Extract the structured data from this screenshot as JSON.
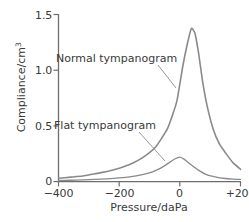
{
  "chart_data": {
    "type": "line",
    "title": "",
    "xlabel": "Pressure/daPa",
    "ylabel": "Compliance/cm",
    "ylabel_sup": "3",
    "xlim": [
      -400,
      200
    ],
    "ylim": [
      0,
      1.5
    ],
    "xticks": [
      "−400",
      "−200",
      "0",
      "+200"
    ],
    "xtick_values": [
      -400,
      -200,
      0,
      200
    ],
    "yticks": [
      "0",
      "0.5",
      "1.0",
      "1.5"
    ],
    "ytick_values": [
      0,
      0.5,
      1.0,
      1.5
    ],
    "grid": false,
    "legend": "annotations",
    "line_color": "#8a8a8a",
    "axis_color": "#6e6e6e",
    "text_color": "#3a3a3a",
    "series": [
      {
        "name": "Normal tympanogram",
        "annotation": "Normal tympanogram",
        "peak_x": 38,
        "peak_y": 1.375,
        "x": [
          -400,
          -360,
          -320,
          -280,
          -240,
          -200,
          -160,
          -120,
          -80,
          -40,
          -10,
          10,
          25,
          38,
          50,
          62,
          75,
          90,
          110,
          130,
          150,
          175,
          200
        ],
        "y": [
          0.03,
          0.04,
          0.05,
          0.07,
          0.09,
          0.12,
          0.16,
          0.22,
          0.31,
          0.48,
          0.72,
          1.04,
          1.24,
          1.375,
          1.33,
          1.15,
          0.9,
          0.68,
          0.47,
          0.34,
          0.26,
          0.17,
          0.11
        ]
      },
      {
        "name": "Flat tympanogram",
        "annotation": "Flat tympanogram",
        "peak_x": 0,
        "peak_y": 0.22,
        "x": [
          -400,
          -360,
          -320,
          -280,
          -240,
          -200,
          -160,
          -120,
          -90,
          -60,
          -35,
          -15,
          0,
          15,
          35,
          60,
          90,
          120,
          150,
          175,
          200
        ],
        "y": [
          0.01,
          0.012,
          0.015,
          0.02,
          0.025,
          0.033,
          0.045,
          0.065,
          0.088,
          0.125,
          0.17,
          0.205,
          0.22,
          0.2,
          0.155,
          0.105,
          0.06,
          0.04,
          0.028,
          0.022,
          0.02
        ]
      }
    ]
  }
}
